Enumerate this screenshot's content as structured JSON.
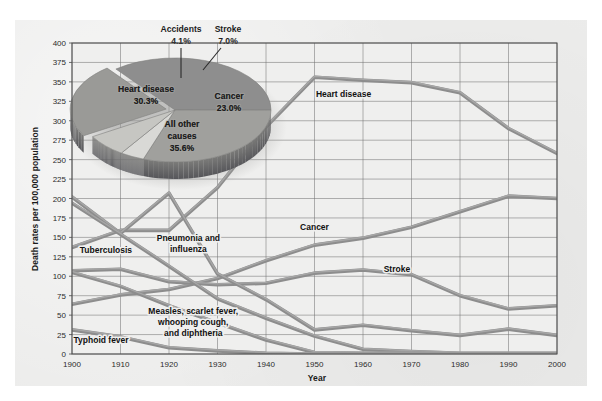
{
  "figure": {
    "background_color": "#ececeb",
    "plot_background_color": "#efefee",
    "grid_color": "#6f6f6f",
    "line_color": "#8d8d8d",
    "line_highlight_color": "#a6a6a6",
    "axis_color": "#4a4a4a"
  },
  "chart_data": {
    "type": "line",
    "title": "",
    "subtitle": "",
    "xlabel": "Year",
    "ylabel": "Death rates per 100,000 population",
    "xlim": [
      1900,
      2000
    ],
    "ylim": [
      0,
      400
    ],
    "ytick_step": 25,
    "grid": true,
    "legend": "inline-labels",
    "categories": [
      1900,
      1910,
      1920,
      1930,
      1940,
      1950,
      1960,
      1970,
      1980,
      1990,
      2000
    ],
    "xticks": [
      "1900",
      "1910",
      "1920",
      "1930",
      "1940",
      "1950",
      "1960",
      "1970",
      "1980",
      "1990",
      "2000"
    ],
    "yticks": [
      "0",
      "25",
      "50",
      "75",
      "100",
      "125",
      "150",
      "175",
      "200",
      "225",
      "250",
      "275",
      "300",
      "325",
      "350",
      "375",
      "400"
    ],
    "series": [
      {
        "name": "Heart disease",
        "label": "Heart disease",
        "label_x": 1956,
        "label_y": 330,
        "values": [
          137,
          159,
          159,
          214,
          292,
          356,
          352,
          349,
          336,
          290,
          258
        ]
      },
      {
        "name": "Cancer",
        "label": "Cancer",
        "label_x": 1950,
        "label_y": 160,
        "values": [
          64,
          76,
          83,
          97,
          120,
          140,
          149,
          163,
          183,
          203,
          200
        ]
      },
      {
        "name": "Stroke",
        "label": "Stroke",
        "label_x": 1967,
        "label_y": 105,
        "values": [
          107,
          109,
          93,
          89,
          91,
          104,
          108,
          102,
          75,
          58,
          62
        ]
      },
      {
        "name": "Pneumonia and influenza",
        "label": "Pneumonia and influenza",
        "label_x": 1924,
        "label_y": 145,
        "values": [
          202,
          155,
          207,
          103,
          70,
          31,
          37,
          30,
          24,
          32,
          24
        ]
      },
      {
        "name": "Tuberculosis",
        "label": "Tuberculosis",
        "label_x": 1907,
        "label_y": 130,
        "values": [
          194,
          154,
          113,
          71,
          46,
          23,
          6,
          3,
          1,
          1,
          1
        ]
      },
      {
        "name": "Measles, scarlet fever, whooping cough, and diphtheria",
        "label": "Measles, scarlet fever, whooping cough, and diphtheria",
        "label_x": 1925,
        "label_y": 52,
        "values": [
          105,
          87,
          62,
          40,
          18,
          2,
          1,
          1,
          0,
          0,
          0
        ]
      },
      {
        "name": "Typhoid fever",
        "label": "Typhoid fever",
        "label_x": 1906,
        "label_y": 14,
        "values": [
          31,
          22,
          8,
          4,
          1,
          0,
          0,
          0,
          0,
          0,
          0
        ]
      }
    ],
    "series_label_lines": {
      "Pneumonia and influenza": [
        "Pneumonia and",
        "influenza"
      ],
      "Measles, scarlet fever, whooping cough, and diphtheria": [
        "Measles, scarlet fever,",
        "whooping cough,",
        "and diphtheria"
      ]
    }
  },
  "pie_chart": {
    "type": "pie",
    "title": "",
    "slices": [
      {
        "name": "All other causes",
        "label_lines": [
          "All other",
          "causes",
          "35.6%"
        ],
        "percent": 35.6,
        "color": "#8e8e8e"
      },
      {
        "name": "Heart disease",
        "label_lines": [
          "Heart disease",
          "30.3%"
        ],
        "percent": 30.3,
        "color": "#a0a09d"
      },
      {
        "name": "Accidents",
        "label_lines": [
          "Accidents",
          "4.1%"
        ],
        "percent": 4.1,
        "color": "#d9d9d6"
      },
      {
        "name": "Stroke",
        "label_lines": [
          "Stroke",
          "7.0%"
        ],
        "percent": 7.0,
        "color": "#c6c6c2"
      },
      {
        "name": "Cancer",
        "label_lines": [
          "Cancer",
          "23.0%"
        ],
        "percent": 23.0,
        "color": "#9a9a97"
      }
    ],
    "callouts": [
      {
        "name": "Accidents",
        "line1": "Accidents",
        "line2": "4.1%"
      },
      {
        "name": "Stroke",
        "line1": "Stroke",
        "line2": "7.0%"
      }
    ]
  }
}
